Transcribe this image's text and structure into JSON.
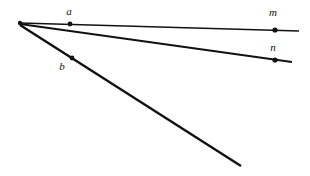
{
  "figure": {
    "background_color": "#ffffff",
    "stroke_color": "#111111",
    "point_color": "#111111",
    "label_color": "#111111",
    "width": 310,
    "height": 176,
    "vertex": {
      "name": "common-vertex",
      "x": 20,
      "y": 23
    },
    "rays": [
      {
        "id": "ray-m",
        "label": "m",
        "label_x": 273,
        "label_y": 16,
        "from_x": 20,
        "from_y": 23,
        "to_x": 299,
        "to_y": 31,
        "stroke_width": 1.6
      },
      {
        "id": "ray-n",
        "label": "n",
        "label_x": 273,
        "label_y": 51,
        "from_x": 20,
        "from_y": 24,
        "to_x": 292,
        "to_y": 62,
        "stroke_width": 1.9
      },
      {
        "id": "ray-steep",
        "label": "",
        "from_x": 20,
        "from_y": 25,
        "to_x": 241,
        "to_y": 166,
        "stroke_width": 2.4
      }
    ],
    "points": [
      {
        "id": "point-a",
        "label": "a",
        "x": 70,
        "y": 24,
        "r": 2.4,
        "label_x": 69,
        "label_y": 15
      },
      {
        "id": "point-b",
        "label": "b",
        "x": 72,
        "y": 58,
        "r": 2.4,
        "label_x": 62,
        "label_y": 70
      },
      {
        "id": "point-m",
        "label": "",
        "x": 275,
        "y": 30,
        "r": 2.6,
        "label_x": 275,
        "label_y": 30
      },
      {
        "id": "point-n",
        "label": "",
        "x": 275,
        "y": 60,
        "r": 2.6,
        "label_x": 275,
        "label_y": 60
      }
    ]
  }
}
